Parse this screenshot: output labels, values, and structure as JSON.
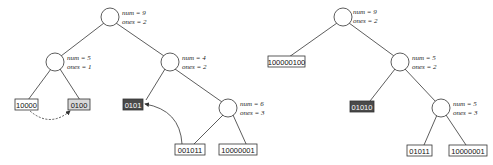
{
  "colors": {
    "line": "#333333",
    "leaf_fill": "#ffffff",
    "leaf_gray_fill": "#d9d9d9",
    "leaf_dark_fill": "#4a4a4a"
  },
  "trees": [
    {
      "name": "before",
      "nodes": [
        {
          "id": "root",
          "num": "num = 9",
          "ones": "ones = 2"
        },
        {
          "id": "left",
          "num": "num = 5",
          "ones": "ones = 1"
        },
        {
          "id": "right",
          "num": "num = 4",
          "ones": "ones = 2"
        },
        {
          "id": "right-right",
          "num": "num = 6",
          "ones": "ones = 3"
        }
      ],
      "leaves": [
        {
          "text": "10000",
          "style": "plain"
        },
        {
          "text": "0100",
          "style": "gray"
        },
        {
          "text": "0101",
          "style": "dark"
        },
        {
          "text": "001011",
          "style": "plain"
        },
        {
          "text": "10000001",
          "style": "plain"
        }
      ]
    },
    {
      "name": "after",
      "nodes": [
        {
          "id": "root",
          "num": "num = 9",
          "ones": "ones = 2"
        },
        {
          "id": "right",
          "num": "num = 5",
          "ones": "ones = 2"
        },
        {
          "id": "right-right",
          "num": "num = 5",
          "ones": "ones = 3"
        }
      ],
      "leaves": [
        {
          "text": "100000100",
          "style": "plain"
        },
        {
          "text": "01010",
          "style": "dark"
        },
        {
          "text": "01011",
          "style": "plain"
        },
        {
          "text": "10000001",
          "style": "plain"
        }
      ]
    }
  ]
}
